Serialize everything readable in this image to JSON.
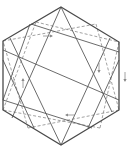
{
  "diagram": {
    "colors": {
      "background": "#ffffff",
      "outer_stroke": "#4a4a4a",
      "inner_solid_stroke": "#5a5a5a",
      "inner_dashed_stroke": "#8a8a8a",
      "arrow": "#8a8a8a"
    },
    "outer_hexagon": [
      [
        61,
        7
      ],
      [
        119,
        42
      ],
      [
        119,
        110
      ],
      [
        61,
        145
      ],
      [
        3,
        110
      ],
      [
        3,
        41
      ]
    ],
    "solid_lines": [
      [
        [
          61,
          7
        ],
        [
          12,
          118
        ]
      ],
      [
        [
          61,
          7
        ],
        [
          112,
          112
        ]
      ],
      [
        [
          61,
          145
        ],
        [
          10,
          38
        ]
      ],
      [
        [
          61,
          145
        ],
        [
          110,
          38
        ]
      ],
      [
        [
          31,
          24
        ],
        [
          119,
          52
        ]
      ],
      [
        [
          3,
          50
        ],
        [
          119,
          100
        ]
      ],
      [
        [
          3,
          100
        ],
        [
          92,
          128
        ]
      ],
      [
        [
          3,
          60
        ],
        [
          34,
          128
        ]
      ],
      [
        [
          119,
          60
        ],
        [
          88,
          128
        ]
      ],
      [
        [
          30,
          24
        ],
        [
          3,
          100
        ]
      ]
    ],
    "dashed_lines": [
      [
        [
          3,
          41
        ],
        [
          96,
          24
        ]
      ],
      [
        [
          96,
          24
        ],
        [
          119,
          110
        ]
      ],
      [
        [
          119,
          110
        ],
        [
          28,
          128
        ]
      ],
      [
        [
          28,
          128
        ],
        [
          3,
          41
        ]
      ],
      [
        [
          36,
          22
        ],
        [
          119,
          42
        ]
      ],
      [
        [
          119,
          42
        ],
        [
          100,
          128
        ]
      ],
      [
        [
          100,
          128
        ],
        [
          3,
          110
        ]
      ],
      [
        [
          3,
          110
        ],
        [
          36,
          22
        ]
      ]
    ],
    "arrows": [
      {
        "name": "arrow-top-right",
        "x": 48,
        "y": 36,
        "dir": "right"
      },
      {
        "name": "arrow-inner-right-down",
        "x": 99,
        "y": 68,
        "dir": "down"
      },
      {
        "name": "arrow-outer-right-down",
        "x": 125,
        "y": 77,
        "dir": "down"
      },
      {
        "name": "arrow-left-up",
        "x": 23,
        "y": 83,
        "dir": "up"
      },
      {
        "name": "arrow-bottom-left",
        "x": 70,
        "y": 115,
        "dir": "left"
      }
    ]
  }
}
